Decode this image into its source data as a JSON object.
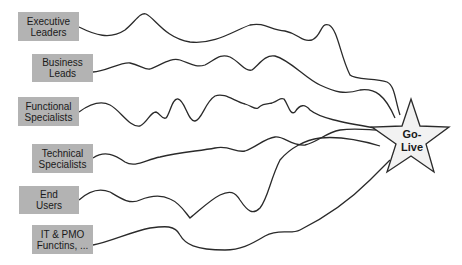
{
  "diagram": {
    "stakeholders": [
      {
        "line1": "Executive",
        "line2": "Leaders"
      },
      {
        "line1": "Business",
        "line2": "Leads"
      },
      {
        "line1": "Functional",
        "line2": "Specialists"
      },
      {
        "line1": "Technical",
        "line2": "Specialists"
      },
      {
        "line1": "End",
        "line2": "Users"
      },
      {
        "line1": "IT & PMO",
        "line2": "Functins, ..."
      }
    ],
    "target": {
      "line1": "Go-",
      "line2": "Live"
    },
    "colors": {
      "box_fill": "#b3b3b3",
      "star_fill": "#f2f2f2",
      "line": "#2a2a2a"
    }
  }
}
